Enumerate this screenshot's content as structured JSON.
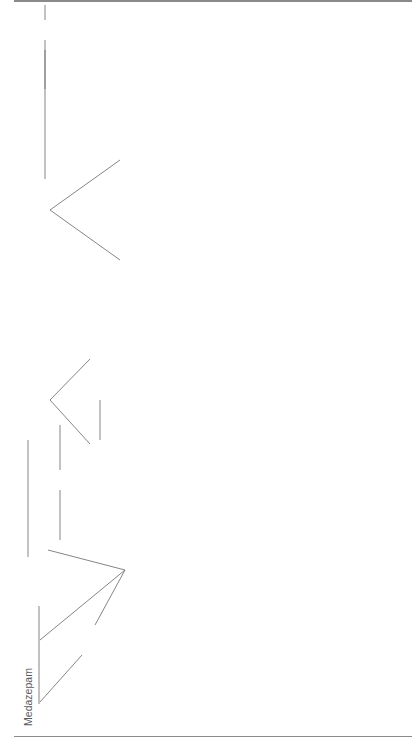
{
  "figure": {
    "number": "Figure 4.2",
    "caption": "Metabolic pathways for selected benzodiazepines. Figures refer to plasma elimination halflives in hours of pharmacologically active substances.",
    "footnotes": [
      "a. lorazepate is a pro-drug",
      "b. lorazepam does not use the P450 hepatic metabolic pathway and avoids interactions relating to competitive inhibition of metabolism",
      "c. α-hydroxymidazolam glucuronide is an active substance, about 10 times less potent than both the unconjugated form and midazolam; accumulation in severe renal failure may lead to"
    ]
  },
  "nodes": {
    "medazepam": {
      "name": "Medazepam"
    },
    "lorazepate": {
      "name": "[Lorazepate]",
      "sup": "a"
    },
    "chlordiazepoxide": {
      "name": "Chlordiazepoxide",
      "halflife": "5–30"
    },
    "desmethylmedazepam": {
      "name": "Desmethylmedazepam"
    },
    "diazepam": {
      "name": "Diazepam",
      "halflife": "24–120"
    },
    "demoxepam": {
      "name": "Demoxepam"
    },
    "nordiazepam": {
      "name": "Nordiazepam",
      "alt": "(Desmethyldiazepam)",
      "halflife": "30–200"
    },
    "temazepam": {
      "name": "Temazepam",
      "halflife": "8–15"
    },
    "oxazepam": {
      "name": "Oxazepam",
      "halflife": "3–21"
    },
    "clonazepam": {
      "name": "Clonazepam",
      "halflife": "20–40"
    },
    "aminoclonazepam": {
      "name": "Aminoclonazepam"
    },
    "acetamidoclonazepam": {
      "name": "Acetamidoclonazepam"
    },
    "nitrazepam": {
      "name": "Nitrazepam",
      "halflife": "15–40"
    },
    "nitrazepam_metabolites_1": {
      "name": "metabolites"
    },
    "nitrazepam_metabolites_2": {
      "name": "metabolites"
    },
    "lorazepam": {
      "name": "Lorazepam",
      "sup": "b",
      "halflife": "10–20"
    },
    "midazolam": {
      "name": "Midazolam",
      "halflife": "2–5"
    },
    "hydroxymidazolam": {
      "name": "α-Hydroxymidazolam",
      "sup": "c",
      "halflife": "1–3"
    },
    "conj_temazepam": {
      "name": "conjugated"
    },
    "conj_oxazepam": {
      "name": "conjugated"
    },
    "conj_aminoclonazepam": {
      "name": "conjugated"
    },
    "conj_nitrazepam": {
      "name": "conjugated"
    },
    "conj_lorazepam": {
      "name": "conjugated"
    },
    "conj_midazolam": {
      "name": "conjugated",
      "sup": "c"
    }
  }
}
